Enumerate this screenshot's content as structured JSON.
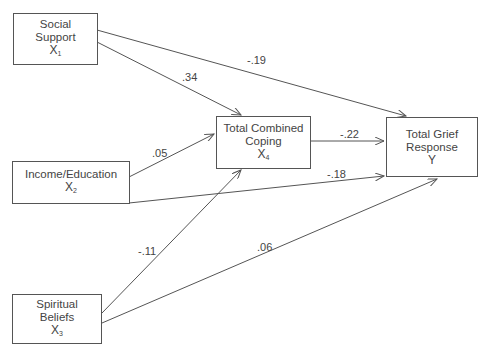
{
  "diagram": {
    "type": "path-model",
    "nodes": [
      {
        "id": "x1",
        "lines": [
          "Social",
          "Support"
        ],
        "var": "X",
        "sub": "1"
      },
      {
        "id": "x2",
        "lines": [
          "Income/Education"
        ],
        "var": "X",
        "sub": "2"
      },
      {
        "id": "x3",
        "lines": [
          "Spiritual",
          "Beliefs"
        ],
        "var": "X",
        "sub": "3"
      },
      {
        "id": "x4",
        "lines": [
          "Total Combined",
          "Coping"
        ],
        "var": "X",
        "sub": "4"
      },
      {
        "id": "y",
        "lines": [
          "Total Grief",
          "Response"
        ],
        "var": "Y",
        "sub": ""
      }
    ],
    "edges": [
      {
        "from": "x1",
        "to": "x4",
        "coef": ".34"
      },
      {
        "from": "x1",
        "to": "y",
        "coef": "-.19"
      },
      {
        "from": "x2",
        "to": "x4",
        "coef": ".05"
      },
      {
        "from": "x2",
        "to": "y",
        "coef": "-.18"
      },
      {
        "from": "x3",
        "to": "x4",
        "coef": "-.11"
      },
      {
        "from": "x3",
        "to": "y",
        "coef": ".06"
      },
      {
        "from": "x4",
        "to": "y",
        "coef": "-.22"
      }
    ]
  }
}
